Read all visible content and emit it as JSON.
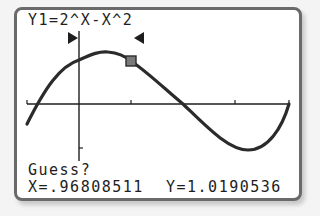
{
  "screen": {
    "equation": "Y1=2^X-X^2",
    "prompt": "Guess?",
    "cursor_x_label": "X=.96808511",
    "cursor_y_label": "Y=1.0190536"
  },
  "graph": {
    "function": "Y1=2^X-X^2",
    "left_bound_marker": "right-pointing triangle",
    "right_bound_marker": "left-pointing triangle",
    "cursor_marker": "square",
    "cursor": {
      "x": 0.96808511,
      "y": 1.0190536
    }
  },
  "colors": {
    "frame_border": "#6a6a6a",
    "screen_bg": "#ffffff",
    "ink": "#1e1e1e",
    "curve": "#2b2b2b",
    "cursor_fill": "#7a7a7a"
  }
}
